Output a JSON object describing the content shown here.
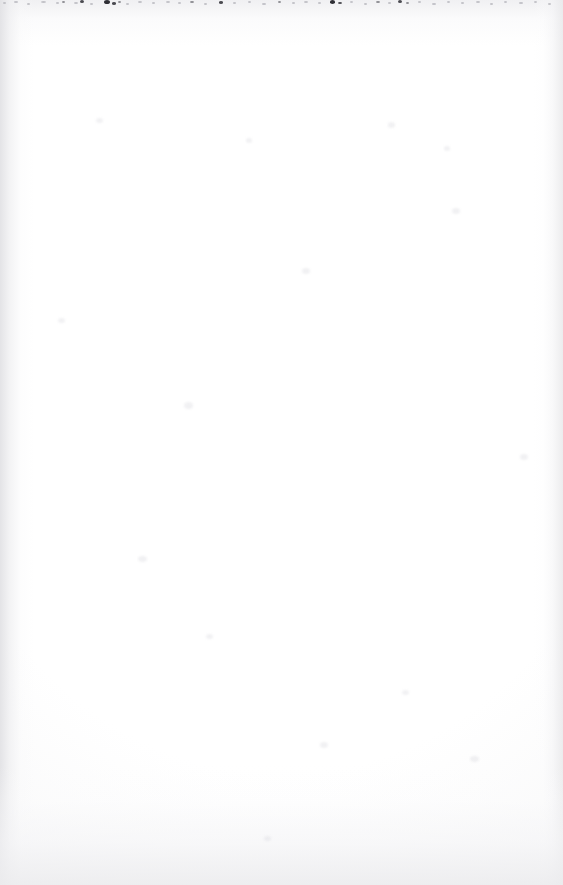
{
  "document": {
    "kind": "scanned-page",
    "page_state": "blank",
    "visible_text": "",
    "width_px": 563,
    "height_px": 885
  },
  "appearance": {
    "paper_color": "#fefefe",
    "page_background": "#fdfdfd",
    "edge_shadow_color": "#e2e2e5",
    "speckle_color": "#4a4a50",
    "speckle_color_dark": "#2f2f35",
    "speckle_color_faint": "#c2c2c7",
    "grain_color": "#ededf0"
  },
  "artifacts": {
    "top_speckle_band": {
      "label": "scanner-dust-band",
      "y_range_px": [
        0,
        9
      ],
      "specks": [
        {
          "x": 3,
          "y": 2,
          "w": 3,
          "h": 1.5,
          "tone": "faint"
        },
        {
          "x": 14,
          "y": 1,
          "w": 4,
          "h": 1.5,
          "tone": "faint"
        },
        {
          "x": 27,
          "y": 3,
          "w": 3,
          "h": 1.5,
          "tone": "faint"
        },
        {
          "x": 41,
          "y": 1,
          "w": 5,
          "h": 2,
          "tone": "faint"
        },
        {
          "x": 56,
          "y": 2,
          "w": 3,
          "h": 1.5,
          "tone": "faint"
        },
        {
          "x": 62,
          "y": 1,
          "w": 3,
          "h": 2,
          "tone": "normal"
        },
        {
          "x": 74,
          "y": 2,
          "w": 4,
          "h": 2,
          "tone": "faint"
        },
        {
          "x": 80,
          "y": 0,
          "w": 4,
          "h": 3,
          "tone": "dark"
        },
        {
          "x": 90,
          "y": 3,
          "w": 3,
          "h": 1.5,
          "tone": "faint"
        },
        {
          "x": 104,
          "y": 0,
          "w": 6,
          "h": 4,
          "tone": "darker"
        },
        {
          "x": 112,
          "y": 2,
          "w": 4,
          "h": 2.5,
          "tone": "dark"
        },
        {
          "x": 118,
          "y": 1,
          "w": 3,
          "h": 2,
          "tone": "normal"
        },
        {
          "x": 126,
          "y": 3,
          "w": 3,
          "h": 1.5,
          "tone": "faint"
        },
        {
          "x": 138,
          "y": 1,
          "w": 4,
          "h": 2,
          "tone": "faint"
        },
        {
          "x": 152,
          "y": 2,
          "w": 3,
          "h": 1.5,
          "tone": "faint"
        },
        {
          "x": 166,
          "y": 1,
          "w": 4,
          "h": 2,
          "tone": "faint"
        },
        {
          "x": 178,
          "y": 2,
          "w": 3,
          "h": 1.5,
          "tone": "faint"
        },
        {
          "x": 190,
          "y": 1,
          "w": 4,
          "h": 2,
          "tone": "normal"
        },
        {
          "x": 204,
          "y": 3,
          "w": 3,
          "h": 1.5,
          "tone": "faint"
        },
        {
          "x": 219,
          "y": 1,
          "w": 4,
          "h": 2.5,
          "tone": "dark"
        },
        {
          "x": 233,
          "y": 2,
          "w": 3,
          "h": 1.5,
          "tone": "faint"
        },
        {
          "x": 248,
          "y": 1,
          "w": 3,
          "h": 2,
          "tone": "faint"
        },
        {
          "x": 262,
          "y": 3,
          "w": 4,
          "h": 1.5,
          "tone": "faint"
        },
        {
          "x": 278,
          "y": 1,
          "w": 3,
          "h": 2,
          "tone": "normal"
        },
        {
          "x": 292,
          "y": 2,
          "w": 3,
          "h": 1.5,
          "tone": "faint"
        },
        {
          "x": 304,
          "y": 1,
          "w": 4,
          "h": 2,
          "tone": "faint"
        },
        {
          "x": 318,
          "y": 2,
          "w": 3,
          "h": 1.5,
          "tone": "faint"
        },
        {
          "x": 330,
          "y": 0,
          "w": 5,
          "h": 3.5,
          "tone": "darker"
        },
        {
          "x": 338,
          "y": 2,
          "w": 4,
          "h": 2,
          "tone": "dark"
        },
        {
          "x": 350,
          "y": 1,
          "w": 3,
          "h": 2,
          "tone": "faint"
        },
        {
          "x": 364,
          "y": 3,
          "w": 3,
          "h": 1.5,
          "tone": "faint"
        },
        {
          "x": 376,
          "y": 1,
          "w": 4,
          "h": 2,
          "tone": "normal"
        },
        {
          "x": 388,
          "y": 2,
          "w": 3,
          "h": 1.5,
          "tone": "faint"
        },
        {
          "x": 398,
          "y": 0,
          "w": 4,
          "h": 3,
          "tone": "dark"
        },
        {
          "x": 406,
          "y": 2,
          "w": 3,
          "h": 2,
          "tone": "normal"
        },
        {
          "x": 418,
          "y": 1,
          "w": 3,
          "h": 1.5,
          "tone": "faint"
        },
        {
          "x": 432,
          "y": 3,
          "w": 4,
          "h": 1.5,
          "tone": "faint"
        },
        {
          "x": 447,
          "y": 1,
          "w": 3,
          "h": 2,
          "tone": "faint"
        },
        {
          "x": 461,
          "y": 2,
          "w": 3,
          "h": 1.5,
          "tone": "faint"
        },
        {
          "x": 476,
          "y": 1,
          "w": 4,
          "h": 2,
          "tone": "faint"
        },
        {
          "x": 490,
          "y": 3,
          "w": 3,
          "h": 1.5,
          "tone": "faint"
        },
        {
          "x": 504,
          "y": 1,
          "w": 3,
          "h": 2,
          "tone": "faint"
        },
        {
          "x": 519,
          "y": 2,
          "w": 4,
          "h": 1.5,
          "tone": "faint"
        },
        {
          "x": 534,
          "y": 1,
          "w": 3,
          "h": 2,
          "tone": "faint"
        },
        {
          "x": 548,
          "y": 3,
          "w": 3,
          "h": 1.5,
          "tone": "faint"
        }
      ]
    },
    "noise_blobs": [
      {
        "x": 96,
        "y": 118,
        "w": 7,
        "h": 5
      },
      {
        "x": 184,
        "y": 402,
        "w": 9,
        "h": 7
      },
      {
        "x": 246,
        "y": 138,
        "w": 6,
        "h": 5
      },
      {
        "x": 302,
        "y": 268,
        "w": 8,
        "h": 6
      },
      {
        "x": 388,
        "y": 122,
        "w": 7,
        "h": 6
      },
      {
        "x": 444,
        "y": 146,
        "w": 6,
        "h": 5
      },
      {
        "x": 452,
        "y": 208,
        "w": 8,
        "h": 6
      },
      {
        "x": 138,
        "y": 556,
        "w": 9,
        "h": 6
      },
      {
        "x": 206,
        "y": 634,
        "w": 7,
        "h": 5
      },
      {
        "x": 320,
        "y": 742,
        "w": 8,
        "h": 6
      },
      {
        "x": 402,
        "y": 690,
        "w": 7,
        "h": 5
      },
      {
        "x": 470,
        "y": 756,
        "w": 9,
        "h": 6
      },
      {
        "x": 58,
        "y": 318,
        "w": 7,
        "h": 5
      },
      {
        "x": 520,
        "y": 454,
        "w": 8,
        "h": 6
      },
      {
        "x": 264,
        "y": 836,
        "w": 7,
        "h": 5
      }
    ]
  }
}
